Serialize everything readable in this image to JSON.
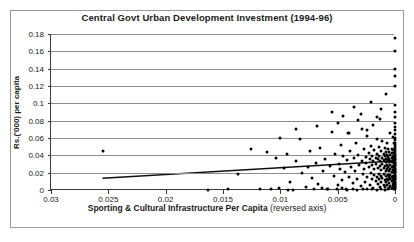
{
  "chart_data": {
    "type": "scatter",
    "title": "Central Govt Urban Development Investment (1994-96)",
    "xlabel_bold": "Sporting & Cultural Infrastructure Per Capita",
    "xlabel_note": "(reversed axis)",
    "ylabel": "Rs.('000) per capita",
    "xlim": [
      0.03,
      0
    ],
    "ylim": [
      0,
      0.18
    ],
    "reversed_x_axis": true,
    "grid": true,
    "legend": "none",
    "xticks": [
      0.03,
      0.025,
      0.02,
      0.015,
      0.01,
      0.005,
      0
    ],
    "xtick_labels": [
      "0.03",
      "0.025",
      "0.02",
      "0.015",
      "0.01",
      "0.005",
      "0"
    ],
    "yticks": [
      0,
      0.02,
      0.04,
      0.06,
      0.08,
      0.1,
      0.12,
      0.14,
      0.16,
      0.18
    ],
    "ytick_labels": [
      "0",
      "0.02",
      "0.04",
      "0.06",
      "0.08",
      "0.1",
      "0.12",
      "0.14",
      "0.16",
      "0.18"
    ],
    "trendline": {
      "x0": 0.0255,
      "y0": 0.0125,
      "x1": 0.0,
      "y1": 0.0325
    },
    "points": [
      [
        0.0255,
        0.045
      ],
      [
        0.0163,
        0.0005
      ],
      [
        0.0137,
        0.0185
      ],
      [
        0.0118,
        0.0012
      ],
      [
        0.0112,
        0.0435
      ],
      [
        0.0108,
        0.0008
      ],
      [
        0.0104,
        0.0375
      ],
      [
        0.0101,
        0.0022
      ],
      [
        0.01,
        0.06
      ],
      [
        0.0097,
        0.0255
      ],
      [
        0.0094,
        0.041
      ],
      [
        0.0092,
        0.0098
      ],
      [
        0.0089,
        0.0002
      ],
      [
        0.0086,
        0.033
      ],
      [
        0.0083,
        0.0585
      ],
      [
        0.0081,
        0.0195
      ],
      [
        0.0078,
        0.0038
      ],
      [
        0.0076,
        0.0265
      ],
      [
        0.0074,
        0.0445
      ],
      [
        0.0072,
        0.0135
      ],
      [
        0.0069,
        0.0315
      ],
      [
        0.0067,
        0.0072
      ],
      [
        0.0065,
        0.049
      ],
      [
        0.0063,
        0.0225
      ],
      [
        0.0061,
        0.0355
      ],
      [
        0.0059,
        0.0015
      ],
      [
        0.0057,
        0.028
      ],
      [
        0.0055,
        0.0675
      ],
      [
        0.0053,
        0.0165
      ],
      [
        0.0052,
        0.042
      ],
      [
        0.005,
        0.0055
      ],
      [
        0.0049,
        0.0305
      ],
      [
        0.0048,
        0.024
      ],
      [
        0.0047,
        0.052
      ],
      [
        0.0046,
        0.0115
      ],
      [
        0.0045,
        0.039
      ],
      [
        0.0044,
        0.0205
      ],
      [
        0.0043,
        0.0006
      ],
      [
        0.0042,
        0.0345
      ],
      [
        0.0041,
        0.066
      ],
      [
        0.004,
        0.0148
      ],
      [
        0.0039,
        0.0455
      ],
      [
        0.0038,
        0.027
      ],
      [
        0.0037,
        0.0085
      ],
      [
        0.0036,
        0.0368
      ],
      [
        0.0035,
        0.0215
      ],
      [
        0.0034,
        0.0545
      ],
      [
        0.0033,
        0.0125
      ],
      [
        0.0032,
        0.0405
      ],
      [
        0.0031,
        0.029
      ],
      [
        0.003,
        0.0042
      ],
      [
        0.0029,
        0.0335
      ],
      [
        0.0029,
        0.0705
      ],
      [
        0.0028,
        0.018
      ],
      [
        0.0027,
        0.047
      ],
      [
        0.0027,
        0.0248
      ],
      [
        0.0026,
        0.0092
      ],
      [
        0.0025,
        0.0382
      ],
      [
        0.0025,
        0.031
      ],
      [
        0.0024,
        0.0155
      ],
      [
        0.0024,
        0.062
      ],
      [
        0.0023,
        0.043
      ],
      [
        0.0023,
        0.0262
      ],
      [
        0.0022,
        0.0058
      ],
      [
        0.0022,
        0.0352
      ],
      [
        0.0021,
        0.0198
      ],
      [
        0.0021,
        0.0508
      ],
      [
        0.002,
        0.0132
      ],
      [
        0.002,
        0.0398
      ],
      [
        0.002,
        0.0285
      ],
      [
        0.0019,
        0.0028
      ],
      [
        0.0019,
        0.034
      ],
      [
        0.0019,
        0.0752
      ],
      [
        0.0018,
        0.0172
      ],
      [
        0.0018,
        0.0462
      ],
      [
        0.0018,
        0.0238
      ],
      [
        0.0017,
        0.0102
      ],
      [
        0.0017,
        0.0375
      ],
      [
        0.0017,
        0.0302
      ],
      [
        0.0016,
        0.0145
      ],
      [
        0.0016,
        0.0585
      ],
      [
        0.0016,
        0.0418
      ],
      [
        0.0015,
        0.0255
      ],
      [
        0.0015,
        0.0068
      ],
      [
        0.0015,
        0.0358
      ],
      [
        0.0014,
        0.0188
      ],
      [
        0.0014,
        0.0495
      ],
      [
        0.0014,
        0.0122
      ],
      [
        0.0014,
        0.0392
      ],
      [
        0.0013,
        0.0278
      ],
      [
        0.0013,
        0.0035
      ],
      [
        0.0013,
        0.0332
      ],
      [
        0.0013,
        0.0815
      ],
      [
        0.0012,
        0.0165
      ],
      [
        0.0012,
        0.0452
      ],
      [
        0.0012,
        0.0232
      ],
      [
        0.0012,
        0.0095
      ],
      [
        0.0011,
        0.0368
      ],
      [
        0.0011,
        0.0298
      ],
      [
        0.0011,
        0.0138
      ],
      [
        0.0011,
        0.0565
      ],
      [
        0.001,
        0.0412
      ],
      [
        0.001,
        0.025
      ],
      [
        0.001,
        0.0062
      ],
      [
        0.001,
        0.0348
      ],
      [
        0.001,
        0.0182
      ],
      [
        0.0009,
        0.0485
      ],
      [
        0.0009,
        0.0118
      ],
      [
        0.0009,
        0.0388
      ],
      [
        0.0009,
        0.0272
      ],
      [
        0.0009,
        0.003
      ],
      [
        0.0008,
        0.0328
      ],
      [
        0.0008,
        0.0158
      ],
      [
        0.0008,
        0.0442
      ],
      [
        0.0008,
        0.0225
      ],
      [
        0.0008,
        0.0088
      ],
      [
        0.0008,
        0.0362
      ],
      [
        0.0007,
        0.0292
      ],
      [
        0.0007,
        0.0132
      ],
      [
        0.0007,
        0.0545
      ],
      [
        0.0007,
        0.0405
      ],
      [
        0.0007,
        0.0245
      ],
      [
        0.0007,
        0.0055
      ],
      [
        0.0006,
        0.0342
      ],
      [
        0.0006,
        0.0175
      ],
      [
        0.0006,
        0.0475
      ],
      [
        0.0006,
        0.0112
      ],
      [
        0.0006,
        0.0382
      ],
      [
        0.0006,
        0.0268
      ],
      [
        0.0005,
        0.0025
      ],
      [
        0.0005,
        0.0322
      ],
      [
        0.0005,
        0.0152
      ],
      [
        0.0005,
        0.0435
      ],
      [
        0.0005,
        0.0218
      ],
      [
        0.0005,
        0.0082
      ],
      [
        0.0005,
        0.0355
      ],
      [
        0.0004,
        0.0288
      ],
      [
        0.0004,
        0.0128
      ],
      [
        0.0004,
        0.0658
      ],
      [
        0.0004,
        0.04
      ],
      [
        0.0004,
        0.024
      ],
      [
        0.0004,
        0.0048
      ],
      [
        0.0004,
        0.0338
      ],
      [
        0.0004,
        0.0168
      ],
      [
        0.0003,
        0.0468
      ],
      [
        0.0003,
        0.0105
      ],
      [
        0.0003,
        0.0375
      ],
      [
        0.0003,
        0.0262
      ],
      [
        0.0003,
        0.0018
      ],
      [
        0.0003,
        0.0318
      ],
      [
        0.0003,
        0.0145
      ],
      [
        0.0003,
        0.0428
      ],
      [
        0.0003,
        0.0212
      ],
      [
        0.0002,
        0.0075
      ],
      [
        0.0002,
        0.035
      ],
      [
        0.0002,
        0.0282
      ],
      [
        0.0002,
        0.0122
      ],
      [
        0.0002,
        0.0612
      ],
      [
        0.0002,
        0.0395
      ],
      [
        0.0002,
        0.0235
      ],
      [
        0.0002,
        0.0042
      ],
      [
        0.0002,
        0.0332
      ],
      [
        0.0002,
        0.0162
      ],
      [
        0.0002,
        0.0458
      ],
      [
        0.0001,
        0.0098
      ],
      [
        0.0001,
        0.0368
      ],
      [
        0.0001,
        0.0255
      ],
      [
        0.0001,
        0.0012
      ],
      [
        0.0001,
        0.0312
      ],
      [
        0.0001,
        0.0138
      ],
      [
        0.0001,
        0.0422
      ],
      [
        0.0001,
        0.0205
      ],
      [
        0.0001,
        0.0068
      ],
      [
        0.0001,
        0.0345
      ],
      [
        0.0001,
        0.0275
      ],
      [
        0.0001,
        0.0115
      ],
      [
        0.0001,
        0.0538
      ],
      [
        0.0001,
        0.0388
      ],
      [
        0.0001,
        0.0228
      ],
      [
        0.0001,
        0.0036
      ],
      [
        0.0,
        0.175
      ],
      [
        0.0,
        0.16
      ],
      [
        0.0,
        0.14
      ],
      [
        0.0,
        0.131
      ],
      [
        0.0,
        0.12
      ],
      [
        0.0,
        0.0985
      ],
      [
        0.0,
        0.0905
      ],
      [
        0.0,
        0.084
      ],
      [
        0.0,
        0.0768
      ],
      [
        0.0,
        0.0722
      ],
      [
        0.0,
        0.069
      ],
      [
        0.0,
        0.0648
      ],
      [
        0.0,
        0.0602
      ],
      [
        0.0,
        0.0575
      ],
      [
        0.0,
        0.0548
      ],
      [
        0.0,
        0.0518
      ],
      [
        0.0,
        0.0492
      ],
      [
        0.0,
        0.047
      ],
      [
        0.0,
        0.0448
      ],
      [
        0.0,
        0.0425
      ],
      [
        0.0,
        0.0408
      ],
      [
        0.0,
        0.039
      ],
      [
        0.0,
        0.0372
      ],
      [
        0.0,
        0.0358
      ],
      [
        0.0,
        0.0342
      ],
      [
        0.0,
        0.0328
      ],
      [
        0.0,
        0.0312
      ],
      [
        0.0,
        0.0298
      ],
      [
        0.0,
        0.0285
      ],
      [
        0.0,
        0.0272
      ],
      [
        0.0,
        0.0258
      ],
      [
        0.0,
        0.0245
      ],
      [
        0.0,
        0.0232
      ],
      [
        0.0,
        0.0218
      ],
      [
        0.0,
        0.0205
      ],
      [
        0.0,
        0.0192
      ],
      [
        0.0,
        0.0178
      ],
      [
        0.0,
        0.0165
      ],
      [
        0.0,
        0.0152
      ],
      [
        0.0,
        0.0138
      ],
      [
        0.0,
        0.0125
      ],
      [
        0.0,
        0.0112
      ],
      [
        0.0,
        0.0098
      ],
      [
        0.0,
        0.0085
      ],
      [
        0.0,
        0.0072
      ],
      [
        0.0,
        0.0058
      ],
      [
        0.0,
        0.0045
      ],
      [
        0.0,
        0.0032
      ],
      [
        0.0,
        0.002
      ],
      [
        0.0,
        0.0008
      ],
      [
        0.0042,
        0.0002
      ],
      [
        0.0037,
        0.001
      ],
      [
        0.0033,
        0.0004
      ],
      [
        0.0028,
        0.0016
      ],
      [
        0.0024,
        0.0006
      ],
      [
        0.002,
        0.0014
      ],
      [
        0.0016,
        0.0003
      ],
      [
        0.0012,
        0.0011
      ],
      [
        0.0009,
        0.0005
      ],
      [
        0.0006,
        0.0009
      ],
      [
        0.0046,
        0.002
      ],
      [
        0.0051,
        0.0008
      ],
      [
        0.0064,
        0.0018
      ],
      [
        0.0058,
        0.0006
      ],
      [
        0.0071,
        0.001
      ],
      [
        0.0093,
        0.0004
      ],
      [
        0.0126,
        0.047
      ],
      [
        0.0146,
        0.0008
      ],
      [
        0.0055,
        0.0905
      ],
      [
        0.0045,
        0.0855
      ],
      [
        0.0036,
        0.096
      ],
      [
        0.003,
        0.088
      ],
      [
        0.0021,
        0.101
      ],
      [
        0.0012,
        0.093
      ],
      [
        0.0086,
        0.07
      ],
      [
        0.0068,
        0.0742
      ],
      [
        0.005,
        0.0772
      ],
      [
        0.0032,
        0.0805
      ],
      [
        0.004,
        0.0655
      ],
      [
        0.0024,
        0.0688
      ],
      [
        0.0016,
        0.0845
      ],
      [
        0.0008,
        0.1105
      ]
    ]
  }
}
